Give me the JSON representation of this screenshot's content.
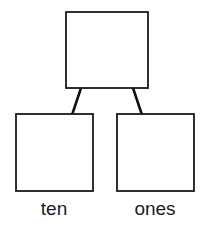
{
  "diagram": {
    "type": "tree",
    "background_color": "#ffffff",
    "stroke_color": "#1a1a1a",
    "connector_color": "#111111",
    "label_color": "#1b1b1b",
    "nodes": [
      {
        "id": "parent",
        "label": "",
        "role": "parent-total-box",
        "x": 66,
        "y": 12,
        "width": 82,
        "height": 76
      },
      {
        "id": "tens",
        "label": "ten",
        "role": "child-place-value-box",
        "x": 16,
        "y": 114,
        "width": 77,
        "height": 77
      },
      {
        "id": "ones",
        "label": "ones",
        "role": "child-place-value-box",
        "x": 117,
        "y": 114,
        "width": 77,
        "height": 77
      }
    ],
    "connectors": [
      {
        "id": "parent-to-tens",
        "from": "parent",
        "to": "tens",
        "x1": 81,
        "y1": 88,
        "x2": 72,
        "y2": 114
      },
      {
        "id": "parent-to-ones",
        "from": "parent",
        "to": "ones",
        "x1": 133,
        "y1": 88,
        "x2": 142,
        "y2": 114
      }
    ],
    "labels": [
      {
        "id": "label-tens",
        "text": "ten",
        "x": 54,
        "y": 214
      },
      {
        "id": "label-ones",
        "text": "ones",
        "x": 155,
        "y": 214
      }
    ]
  }
}
